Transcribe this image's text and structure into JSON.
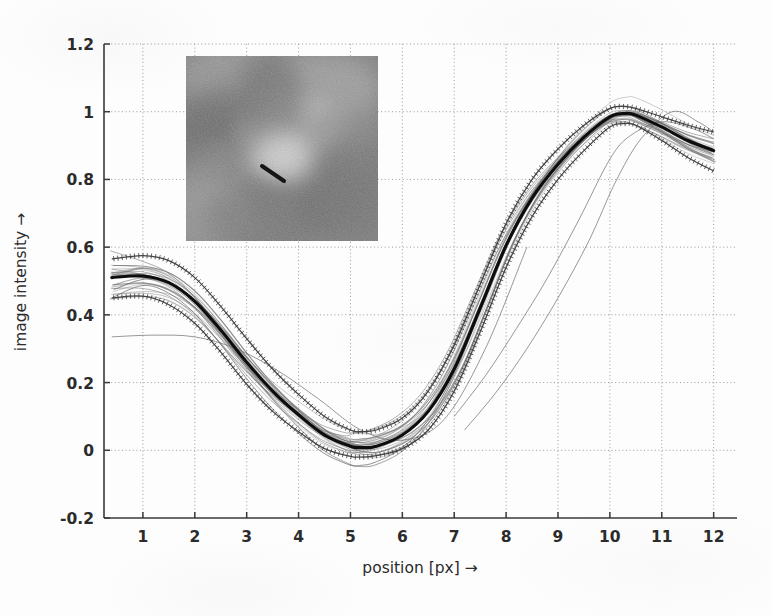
{
  "figure": {
    "title": "",
    "background_color": "#fdfdfd",
    "axis_color": "#3a3a3a",
    "grid_color": "#9a9a9a",
    "mean_curve_color": "#0d0d0d",
    "ensemble_curve_color": "#6e6e6e",
    "errorbar_curve_color": "#3c3c3c"
  },
  "inset": {
    "name": "retinal-fundus-patch",
    "description": "grayscale fundus image patch with dark diagonal vessel marker",
    "x": 186,
    "y": 56,
    "width": 192,
    "height": 185,
    "marker": {
      "x1": 262,
      "y1": 166,
      "x2": 284,
      "y2": 181,
      "color": "#161616",
      "width": 4
    }
  },
  "chart_data": {
    "type": "line",
    "title": "",
    "subtitle": "",
    "xlabel": "position [px] →",
    "ylabel": "image intensity →",
    "xlim": [
      0.25,
      12.45
    ],
    "ylim": [
      -0.2,
      1.2
    ],
    "xticks": [
      1,
      2,
      3,
      4,
      5,
      6,
      7,
      8,
      9,
      10,
      11,
      12
    ],
    "xticklabels": [
      "1",
      "2",
      "3",
      "4",
      "5",
      "6",
      "7",
      "8",
      "9",
      "10",
      "11",
      "12"
    ],
    "yticks": [
      -0.2,
      0,
      0.2,
      0.4,
      0.6,
      0.8,
      1,
      1.2
    ],
    "yticklabels": [
      "-0.2",
      "0",
      "0.2",
      "0.4",
      "0.6",
      "0.8",
      "1",
      "1.2"
    ],
    "grid": true,
    "grid_style": "dotted",
    "legend": null,
    "x": [
      0.4,
      1,
      1.5,
      2,
      2.5,
      3,
      3.5,
      4,
      4.5,
      5,
      5.2,
      5.5,
      6,
      6.5,
      7,
      7.5,
      8,
      8.5,
      9,
      9.5,
      10,
      10.3,
      10.5,
      11,
      11.5,
      12
    ],
    "series": [
      {
        "name": "mean profile",
        "role": "mean",
        "style": "thick-solid-black",
        "values": [
          0.51,
          0.515,
          0.495,
          0.44,
          0.355,
          0.26,
          0.175,
          0.105,
          0.045,
          0.012,
          0.008,
          0.012,
          0.045,
          0.115,
          0.24,
          0.42,
          0.605,
          0.745,
          0.845,
          0.925,
          0.985,
          0.995,
          0.99,
          0.955,
          0.915,
          0.885
        ]
      },
      {
        "name": "mean + standard deviation",
        "role": "upper-bound",
        "style": "dotted-errorbar",
        "values": [
          0.565,
          0.575,
          0.56,
          0.51,
          0.425,
          0.33,
          0.24,
          0.165,
          0.1,
          0.06,
          0.055,
          0.06,
          0.095,
          0.175,
          0.31,
          0.49,
          0.67,
          0.8,
          0.89,
          0.96,
          1.01,
          1.015,
          1.01,
          0.985,
          0.96,
          0.94
        ]
      },
      {
        "name": "mean - standard deviation",
        "role": "lower-bound",
        "style": "dotted-errorbar",
        "values": [
          0.45,
          0.455,
          0.43,
          0.375,
          0.29,
          0.195,
          0.115,
          0.055,
          0.005,
          -0.018,
          -0.02,
          -0.016,
          0.005,
          0.06,
          0.175,
          0.35,
          0.54,
          0.69,
          0.8,
          0.885,
          0.955,
          0.965,
          0.96,
          0.915,
          0.865,
          0.825
        ]
      }
    ],
    "ensemble": {
      "name": "individual intensity profiles",
      "count": 26,
      "style": "thin-gray-solid",
      "note": "family of per-sample cross-section profiles; start values span 0.33-0.62, minimum near x=5.2, peak near x=10.2, end values span 0.76-1.00"
    },
    "annotations": [
      {
        "text": "inset fundus image patch",
        "type": "image-inset"
      }
    ]
  }
}
